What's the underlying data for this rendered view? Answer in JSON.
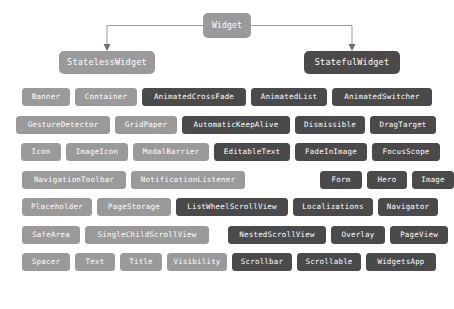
{
  "diagram": {
    "type": "tree-diagram",
    "colors": {
      "background": "#ffffff",
      "light_node": "#9a9a9a",
      "dark_node": "#4a4a4a",
      "connector": "#9a9a9a",
      "node_text": "#ffffff"
    },
    "root": {
      "label": "Widget",
      "style": "light"
    },
    "children": [
      {
        "label": "StatelessWidget",
        "style": "light"
      },
      {
        "label": "StatefulWidget",
        "style": "dark"
      }
    ],
    "rows": [
      {
        "row_index": 0,
        "nodes": [
          {
            "label": "Banner",
            "style": "light",
            "x": 22,
            "width": 48
          },
          {
            "label": "Container",
            "style": "light",
            "x": 75,
            "width": 62
          },
          {
            "label": "AnimatedCrossFade",
            "style": "dark",
            "x": 142,
            "width": 104
          },
          {
            "label": "AnimatedList",
            "style": "dark",
            "x": 251,
            "width": 76
          },
          {
            "label": "AnimatedSwitcher",
            "style": "dark",
            "x": 332,
            "width": 100
          }
        ]
      },
      {
        "row_index": 1,
        "nodes": [
          {
            "label": "GestureDetector",
            "style": "light",
            "x": 16,
            "width": 94
          },
          {
            "label": "GridPaper",
            "style": "light",
            "x": 115,
            "width": 62
          },
          {
            "label": "AutomaticKeepAlive",
            "style": "dark",
            "x": 182,
            "width": 108
          },
          {
            "label": "Dismissible",
            "style": "dark",
            "x": 295,
            "width": 70
          },
          {
            "label": "DragTarget",
            "style": "dark",
            "x": 370,
            "width": 66
          }
        ]
      },
      {
        "row_index": 2,
        "nodes": [
          {
            "label": "Icon",
            "style": "light",
            "x": 21,
            "width": 40
          },
          {
            "label": "ImageIcon",
            "style": "light",
            "x": 66,
            "width": 62
          },
          {
            "label": "ModalBarrier",
            "style": "light",
            "x": 133,
            "width": 76
          },
          {
            "label": "EditableText",
            "style": "dark",
            "x": 214,
            "width": 76
          },
          {
            "label": "FadeInImage",
            "style": "dark",
            "x": 295,
            "width": 72
          },
          {
            "label": "FocusScope",
            "style": "dark",
            "x": 372,
            "width": 68
          }
        ]
      },
      {
        "row_index": 3,
        "nodes": [
          {
            "label": "NavigationToolbar",
            "style": "light",
            "x": 22,
            "width": 104
          },
          {
            "label": "NotificationListener",
            "style": "light",
            "x": 131,
            "width": 114
          },
          {
            "label": "Form",
            "style": "dark",
            "x": 320,
            "width": 42
          },
          {
            "label": "Hero",
            "style": "dark",
            "x": 367,
            "width": 40
          },
          {
            "label": "Image",
            "style": "dark",
            "x": 412,
            "width": 42
          }
        ]
      },
      {
        "row_index": 4,
        "nodes": [
          {
            "label": "Placeholder",
            "style": "light",
            "x": 22,
            "width": 70
          },
          {
            "label": "PageStorage",
            "style": "light",
            "x": 97,
            "width": 74
          },
          {
            "label": "ListWheelScrollView",
            "style": "dark",
            "x": 176,
            "width": 112
          },
          {
            "label": "Localizations",
            "style": "dark",
            "x": 293,
            "width": 80
          },
          {
            "label": "Navigator",
            "style": "dark",
            "x": 378,
            "width": 60
          }
        ]
      },
      {
        "row_index": 5,
        "nodes": [
          {
            "label": "SafeArea",
            "style": "light",
            "x": 22,
            "width": 58
          },
          {
            "label": "SingleChildScrollView",
            "style": "light",
            "x": 85,
            "width": 124
          },
          {
            "label": "NestedScrollView",
            "style": "dark",
            "x": 228,
            "width": 98
          },
          {
            "label": "Overlay",
            "style": "dark",
            "x": 331,
            "width": 54
          },
          {
            "label": "PageView",
            "style": "dark",
            "x": 390,
            "width": 58
          }
        ]
      },
      {
        "row_index": 6,
        "nodes": [
          {
            "label": "Spacer",
            "style": "light",
            "x": 22,
            "width": 48
          },
          {
            "label": "Text",
            "style": "light",
            "x": 75,
            "width": 40
          },
          {
            "label": "Title",
            "style": "light",
            "x": 120,
            "width": 42
          },
          {
            "label": "Visibility",
            "style": "light",
            "x": 167,
            "width": 60
          },
          {
            "label": "Scrollbar",
            "style": "dark",
            "x": 232,
            "width": 60
          },
          {
            "label": "Scrollable",
            "style": "dark",
            "x": 297,
            "width": 64
          },
          {
            "label": "WidgetsApp",
            "style": "dark",
            "x": 366,
            "width": 70
          }
        ]
      }
    ]
  }
}
